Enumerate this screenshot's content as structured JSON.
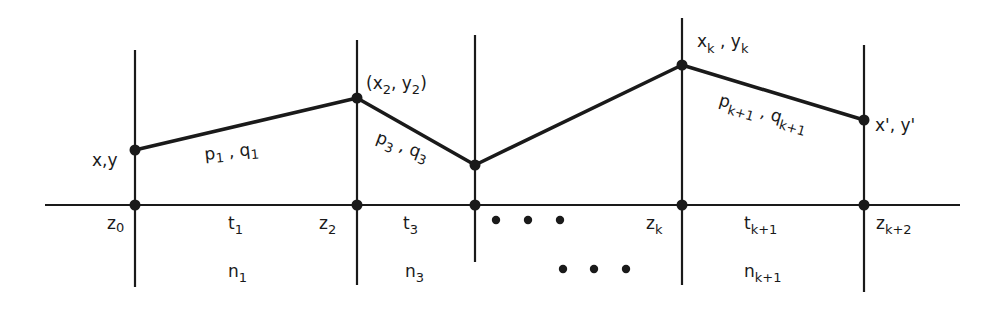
{
  "diagram": {
    "colors": {
      "ink": "#1a1a1a",
      "background": "#ffffff"
    },
    "axis": {
      "label": "depth axis"
    },
    "boundaries": [
      {
        "id": "b0",
        "label": "z",
        "sub": "0"
      },
      {
        "id": "b2",
        "label": "z",
        "sub": "2"
      },
      {
        "id": "b3",
        "label": "",
        "sub": ""
      },
      {
        "id": "bk",
        "label": "z",
        "sub": "k"
      },
      {
        "id": "bk2",
        "label": "z",
        "sub": "k+2"
      }
    ],
    "points": [
      {
        "id": "start",
        "label": "x,y"
      },
      {
        "id": "p2",
        "label_open": "(x",
        "sub1": "2",
        "mid": ", y",
        "sub2": "2",
        "label_close": ")"
      },
      {
        "id": "p3",
        "label": ""
      },
      {
        "id": "pk",
        "label_x": "x",
        "sub1": "k",
        "mid": " , y",
        "sub2": "k"
      },
      {
        "id": "end",
        "label": "x', y'"
      }
    ],
    "segments": [
      {
        "id": "seg1",
        "p": "p",
        "p_sub": "1",
        "sep": " , ",
        "q": "q",
        "q_sub": "1"
      },
      {
        "id": "seg3",
        "p": "p",
        "p_sub": "3",
        "sep": " , ",
        "q": "q",
        "q_sub": "3"
      },
      {
        "id": "segk1",
        "p": "p",
        "p_sub": "k+1",
        "sep": " , ",
        "q": "q",
        "q_sub": "k+1"
      }
    ],
    "thickness_labels": [
      {
        "id": "t1",
        "label": "t",
        "sub": "1"
      },
      {
        "id": "t3",
        "label": "t",
        "sub": "3"
      },
      {
        "id": "tk1",
        "label": "t",
        "sub": "k+1"
      }
    ],
    "index_labels": [
      {
        "id": "n1",
        "label": "n",
        "sub": "1"
      },
      {
        "id": "n3",
        "label": "n",
        "sub": "3"
      },
      {
        "id": "nk1",
        "label": "n",
        "sub": "k+1"
      }
    ],
    "ellipsis": {
      "upper": "• • •",
      "lower": "• • •"
    }
  }
}
